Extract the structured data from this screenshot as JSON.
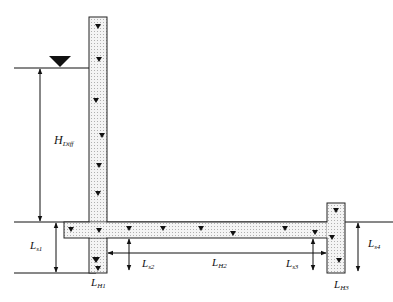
{
  "diagram": {
    "type": "hydraulic pipe system cross-section",
    "colors": {
      "line": "#111111",
      "pipe_fill": "#f2f2f2",
      "pipe_dots": "#8a8a8a",
      "background": "#ffffff"
    },
    "water_level_symbol": "inverted-triangle",
    "labels": {
      "h_diff": {
        "main": "H",
        "sub": "Diff"
      },
      "ls1": {
        "main": "L",
        "sub": "s1"
      },
      "lh1": {
        "main": "L",
        "sub": "H1"
      },
      "ls2": {
        "main": "L",
        "sub": "s2"
      },
      "lh2": {
        "main": "L",
        "sub": "H2"
      },
      "ls3": {
        "main": "L",
        "sub": "s3"
      },
      "lh3": {
        "main": "L",
        "sub": "H3"
      },
      "ls4": {
        "main": "L",
        "sub": "s4"
      }
    },
    "pipes": [
      {
        "name": "vertical-pipe-1",
        "label_ref": "lh1"
      },
      {
        "name": "horizontal-pipe-2",
        "label_ref": "lh2"
      },
      {
        "name": "vertical-pipe-3",
        "label_ref": "lh3"
      }
    ]
  }
}
